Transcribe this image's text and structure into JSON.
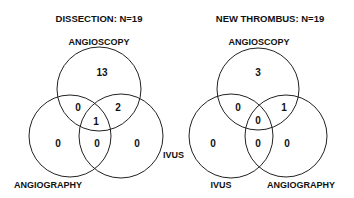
{
  "diagrams": [
    {
      "title": "DISSECTION: N=19",
      "labels": {
        "top": "ANGIOSCOPY",
        "right": "IVUS",
        "left": "ANGIOGRAPHY"
      },
      "regions": {
        "top_only": "13",
        "top_left": "0",
        "top_right": "2",
        "center": "1",
        "left_only": "0",
        "left_right": "0",
        "right_only": "0"
      }
    },
    {
      "title": "NEW THROMBUS: N=19",
      "labels": {
        "top": "ANGIOSCOPY",
        "left": "IVUS",
        "right": "ANGIOGRAPHY"
      },
      "regions": {
        "top_only": "3",
        "top_left": "0",
        "top_right": "1",
        "center": "0",
        "left_only": "0",
        "left_right": "0",
        "right_only": "0"
      }
    }
  ]
}
